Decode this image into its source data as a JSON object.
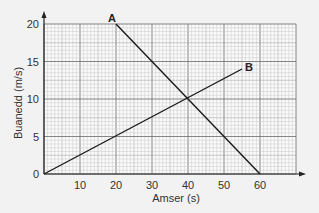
{
  "chart_data": {
    "type": "line",
    "title": "",
    "xlabel": "Amser (s)",
    "ylabel": "Buanedd (m/s)",
    "xlim": [
      0,
      70
    ],
    "ylim": [
      0,
      20
    ],
    "xticks": [
      10,
      20,
      30,
      40,
      50,
      60
    ],
    "yticks": [
      0,
      5,
      10,
      15,
      20
    ],
    "grid": true,
    "series": [
      {
        "name": "A",
        "x": [
          20,
          60
        ],
        "y": [
          20,
          0
        ]
      },
      {
        "name": "B",
        "x": [
          0,
          55
        ],
        "y": [
          0,
          14
        ]
      }
    ]
  }
}
